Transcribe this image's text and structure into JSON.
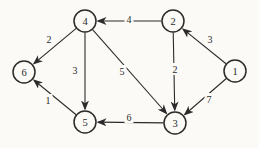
{
  "figure": {
    "background_color": "#fbfaf6",
    "ink_color": "#2b2b2b",
    "canvas": {
      "width": 259,
      "height": 148
    }
  },
  "graph": {
    "type": "weighted-directed-graph",
    "node_radius": 11,
    "nodes": [
      {
        "id": "1",
        "label": "1",
        "x": 235,
        "y": 71
      },
      {
        "id": "2",
        "label": "2",
        "x": 173,
        "y": 21
      },
      {
        "id": "3",
        "label": "3",
        "x": 175,
        "y": 123
      },
      {
        "id": "4",
        "label": "4",
        "x": 85,
        "y": 21
      },
      {
        "id": "5",
        "label": "5",
        "x": 85,
        "y": 122
      },
      {
        "id": "6",
        "label": "6",
        "x": 24,
        "y": 72
      }
    ],
    "edges": [
      {
        "from": "2",
        "to": "4",
        "weight": "4",
        "label_x": 129,
        "label_y": 19
      },
      {
        "from": "1",
        "to": "2",
        "weight": "3",
        "label_x": 210,
        "label_y": 39
      },
      {
        "from": "4",
        "to": "6",
        "weight": "2",
        "label_x": 49,
        "label_y": 39
      },
      {
        "from": "4",
        "to": "5",
        "weight": "3",
        "label_x": 75,
        "label_y": 70
      },
      {
        "from": "4",
        "to": "3",
        "weight": "5",
        "label_x": 122,
        "label_y": 71
      },
      {
        "from": "2",
        "to": "3",
        "weight": "2",
        "label_x": 175,
        "label_y": 69
      },
      {
        "from": "1",
        "to": "3",
        "weight": "7",
        "label_x": 209,
        "label_y": 99
      },
      {
        "from": "3",
        "to": "5",
        "weight": "6",
        "label_x": 129,
        "label_y": 117
      },
      {
        "from": "5",
        "to": "6",
        "weight": "1",
        "label_x": 48,
        "label_y": 100
      }
    ]
  }
}
